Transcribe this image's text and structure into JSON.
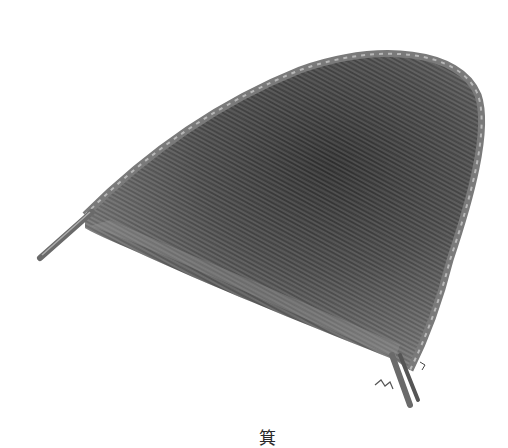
{
  "figure": {
    "caption": "箕",
    "style": "grayscale photograph",
    "colors": {
      "background": "#ffffff",
      "weave_dark": "#3a3a3a",
      "weave_mid": "#6b6b6b",
      "weave_light": "#a8a8a8",
      "rim": "#8a8a8a"
    }
  }
}
